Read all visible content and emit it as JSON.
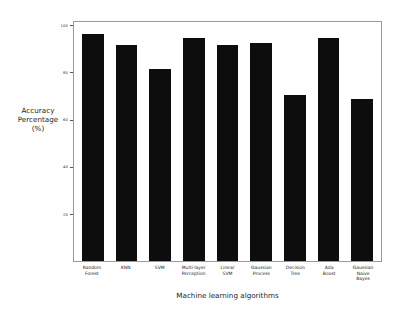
{
  "chart_data": {
    "type": "bar",
    "title": "",
    "xlabel": "Machine learning algorithms",
    "ylabel": "Accuracy\nPercentage\n(%)",
    "ylabel_lines": [
      "Accuracy",
      "Percentage",
      "(%)"
    ],
    "categories": [
      "Random Forest",
      "KNN",
      "SVM",
      "Multi-layer Perception",
      "Linear SVM",
      "Gaussian Process",
      "Decision Tree",
      "Ada Boost",
      "Gaussian Naive Bayes"
    ],
    "category_lines": [
      [
        "Random",
        "Forest"
      ],
      [
        "KNN"
      ],
      [
        "SVM"
      ],
      [
        "Multi-layer",
        "Perception"
      ],
      [
        "Linear",
        "SVM"
      ],
      [
        "Gaussian",
        "Process"
      ],
      [
        "Decision",
        "Tree"
      ],
      [
        "Ada",
        "Boost"
      ],
      [
        "Gaussian",
        "Naive",
        "Bayes"
      ]
    ],
    "values": [
      97,
      92,
      82,
      95,
      92,
      93,
      71,
      95,
      69
    ],
    "ylim": [
      0,
      102
    ],
    "yticks": [
      20,
      40,
      60,
      80,
      100
    ],
    "ytick_labels": [
      "20",
      "40",
      "60",
      "80",
      "100"
    ],
    "grid": false,
    "legend": null,
    "bar_color": "#0d0d0d",
    "frame_color": "#9a9a9a",
    "background_color": "#ffffff"
  }
}
